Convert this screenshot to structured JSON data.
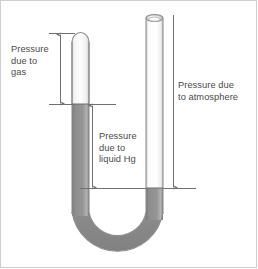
{
  "figure": {
    "type": "u-tube-manometer",
    "labels": {
      "gas": "Pressure\ndue to\ngas",
      "liquid_hg": "Pressure\ndue to\nliquid Hg",
      "atmosphere": "Pressure due\nto atmosphere"
    },
    "colors": {
      "mercury": "#8c8c8c",
      "mercury_dark": "#7b7b7b",
      "gas": "#f2f2f2",
      "tube_outline": "#8f8f8f",
      "arrow": "#707070",
      "text": "#4a4a4a",
      "border": "#cfcfcf",
      "background": "#ffffff"
    },
    "geometry": {
      "left_tube_x": [
        72,
        89
      ],
      "right_tube_x": [
        146,
        163
      ],
      "left_tube_top_y": 33,
      "right_tube_top_y": 15,
      "left_mercury_level_y": 104,
      "right_mercury_level_y": 188,
      "tube_bottom_y": 262
    },
    "arrows": {
      "gas": {
        "x": 60,
        "y_top": 33,
        "y_bottom": 104,
        "heads": "both"
      },
      "liquid_hg": {
        "x": 92,
        "y_top": 104,
        "y_bottom": 188,
        "heads": "both"
      },
      "atmosphere": {
        "x": 173,
        "y_top": 15,
        "y_bottom": 188,
        "heads": "down"
      }
    }
  }
}
